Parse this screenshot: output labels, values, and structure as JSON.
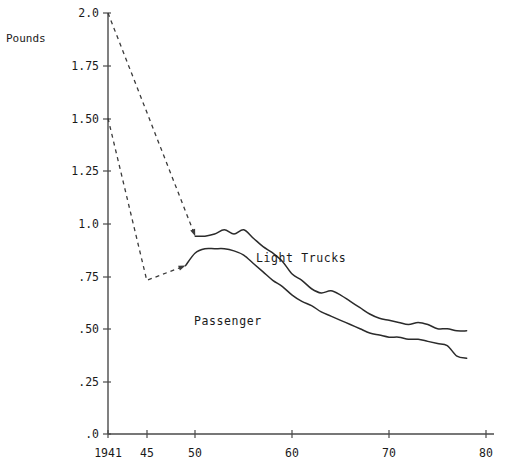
{
  "chart_data": {
    "type": "line",
    "title": "",
    "subtitle": "",
    "ylabel": "Pounds",
    "xlabel": "",
    "ylim": [
      0.0,
      2.0
    ],
    "xlim": [
      1941,
      1980
    ],
    "grid": false,
    "legend_position": "inline-annotations",
    "y_ticks": [
      {
        "value": 2.0,
        "label": "2.0"
      },
      {
        "value": 1.75,
        "label": "1.75"
      },
      {
        "value": 1.5,
        "label": "1.50"
      },
      {
        "value": 1.25,
        "label": "1.25"
      },
      {
        "value": 1.0,
        "label": "1.0"
      },
      {
        "value": 0.75,
        "label": ".75"
      },
      {
        "value": 0.5,
        "label": ".50"
      },
      {
        "value": 0.25,
        "label": ".25"
      },
      {
        "value": 0.0,
        "label": ".0"
      }
    ],
    "x_ticks": [
      {
        "value": 1941,
        "label": "1941"
      },
      {
        "value": 1945,
        "label": "45"
      },
      {
        "value": 1950,
        "label": "50"
      },
      {
        "value": 1960,
        "label": "60"
      },
      {
        "value": 1970,
        "label": "70"
      },
      {
        "value": 1980,
        "label": "80"
      }
    ],
    "series": [
      {
        "name": "Light Trucks",
        "annotation": "Light Trucks",
        "style": "solid",
        "x": [
          1950,
          1951,
          1952,
          1953,
          1954,
          1955,
          1956,
          1957,
          1958,
          1959,
          1960,
          1961,
          1962,
          1963,
          1964,
          1965,
          1966,
          1967,
          1968,
          1969,
          1970,
          1971,
          1972,
          1973,
          1974,
          1975,
          1976,
          1977,
          1978
        ],
        "values": [
          0.94,
          0.94,
          0.95,
          0.97,
          0.95,
          0.97,
          0.93,
          0.89,
          0.86,
          0.82,
          0.76,
          0.73,
          0.69,
          0.67,
          0.68,
          0.66,
          0.63,
          0.6,
          0.57,
          0.55,
          0.54,
          0.53,
          0.52,
          0.53,
          0.52,
          0.5,
          0.5,
          0.49,
          0.49
        ]
      },
      {
        "name": "Light Trucks lead-in",
        "annotation": "",
        "style": "dashed",
        "x": [
          1941,
          1950
        ],
        "values": [
          2.0,
          0.94
        ]
      },
      {
        "name": "Passenger",
        "annotation": "Passenger",
        "style": "solid",
        "x": [
          1949,
          1950,
          1951,
          1952,
          1953,
          1954,
          1955,
          1956,
          1957,
          1958,
          1959,
          1960,
          1961,
          1962,
          1963,
          1964,
          1965,
          1966,
          1967,
          1968,
          1969,
          1970,
          1971,
          1972,
          1973,
          1974,
          1975,
          1976,
          1977,
          1978
        ],
        "values": [
          0.8,
          0.86,
          0.88,
          0.88,
          0.88,
          0.87,
          0.85,
          0.81,
          0.77,
          0.73,
          0.7,
          0.66,
          0.63,
          0.61,
          0.58,
          0.56,
          0.54,
          0.52,
          0.5,
          0.48,
          0.47,
          0.46,
          0.46,
          0.45,
          0.45,
          0.44,
          0.43,
          0.42,
          0.37,
          0.36
        ]
      },
      {
        "name": "Passenger lead-in",
        "annotation": "",
        "style": "dashed",
        "x": [
          1941,
          1945,
          1949
        ],
        "values": [
          1.5,
          0.73,
          0.8
        ]
      }
    ]
  },
  "axis": {
    "y_title": "Pounds"
  }
}
